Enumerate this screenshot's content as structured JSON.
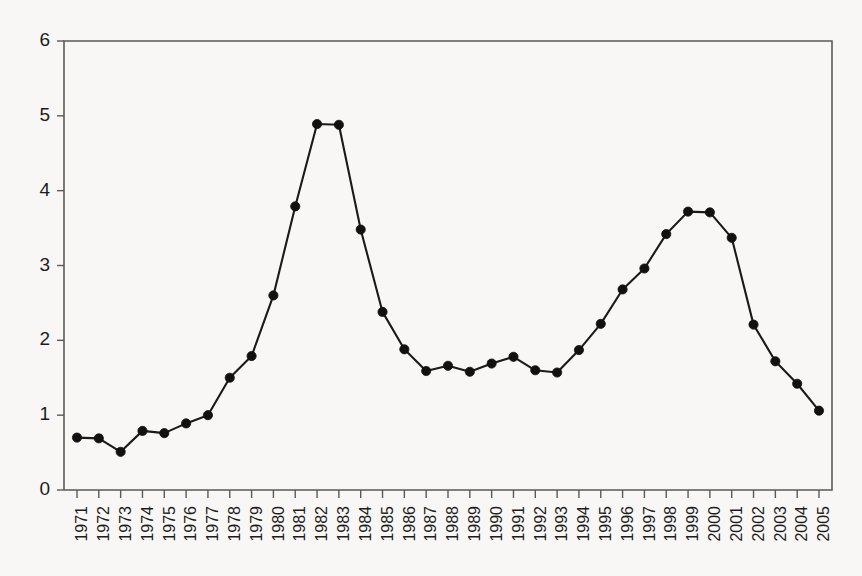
{
  "chart_data": {
    "type": "line",
    "title": "",
    "subtitle": "",
    "xlabel": "",
    "ylabel": "",
    "xlim": [
      1971,
      2005
    ],
    "ylim": [
      0,
      6
    ],
    "ytick_labels": [
      "0",
      "1",
      "2",
      "3",
      "4",
      "5",
      "6"
    ],
    "ytick_values": [
      0,
      1,
      2,
      3,
      4,
      5,
      6
    ],
    "grid": false,
    "legend": null,
    "legend_position": "none",
    "marker": "filled-circle",
    "line_color": "#111111",
    "marker_color": "#111111",
    "axis_color": "#5a5a58",
    "background_color": "#f8f7f5",
    "categories": [
      "1971",
      "1972",
      "1973",
      "1974",
      "1975",
      "1976",
      "1977",
      "1978",
      "1979",
      "1980",
      "1981",
      "1982",
      "1983",
      "1984",
      "1985",
      "1986",
      "1987",
      "1988",
      "1989",
      "1990",
      "1991",
      "1992",
      "1993",
      "1994",
      "1995",
      "1996",
      "1997",
      "1998",
      "1999",
      "2000",
      "2001",
      "2002",
      "2003",
      "2004",
      "2005"
    ],
    "x": [
      1971,
      1972,
      1973,
      1974,
      1975,
      1976,
      1977,
      1978,
      1979,
      1980,
      1981,
      1982,
      1983,
      1984,
      1985,
      1986,
      1987,
      1988,
      1989,
      1990,
      1991,
      1992,
      1993,
      1994,
      1995,
      1996,
      1997,
      1998,
      1999,
      2000,
      2001,
      2002,
      2003,
      2004,
      2005
    ],
    "values": [
      0.7,
      0.69,
      0.51,
      0.79,
      0.76,
      0.89,
      1.0,
      1.5,
      1.79,
      2.6,
      3.79,
      4.89,
      4.88,
      3.48,
      2.38,
      1.88,
      1.59,
      1.66,
      1.58,
      1.69,
      1.78,
      1.6,
      1.57,
      1.87,
      2.22,
      2.68,
      2.96,
      3.42,
      3.72,
      3.71,
      3.37,
      2.21,
      1.72,
      1.42,
      1.06
    ],
    "series": [
      {
        "name": "series-1",
        "values": [
          0.7,
          0.69,
          0.51,
          0.79,
          0.76,
          0.89,
          1.0,
          1.5,
          1.79,
          2.6,
          3.79,
          4.89,
          4.88,
          3.48,
          2.38,
          1.88,
          1.59,
          1.66,
          1.58,
          1.69,
          1.78,
          1.6,
          1.57,
          1.87,
          2.22,
          2.68,
          2.96,
          3.42,
          3.72,
          3.71,
          3.37,
          2.21,
          1.72,
          1.42,
          1.06
        ]
      }
    ]
  }
}
